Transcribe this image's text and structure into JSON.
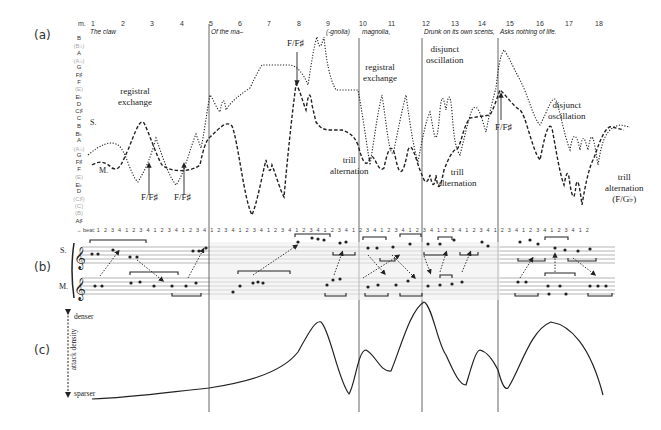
{
  "panels": {
    "a": {
      "label": "(a)",
      "measure_prefix": "m.",
      "measures": [
        "1",
        "2",
        "3",
        "4",
        "5",
        "6",
        "7",
        "8",
        "9",
        "10",
        "11",
        "12",
        "13",
        "14",
        "15",
        "16",
        "17",
        "18"
      ],
      "lyrics": [
        "The claw",
        "Of the ma–",
        "(-gnolia)",
        "magnolia,",
        "Drunk on its own scents,",
        "Asks nothing of life."
      ],
      "pitch_axis": [
        {
          "label": "B",
          "dim": false
        },
        {
          "label": "(B♭)",
          "dim": true
        },
        {
          "label": "A",
          "dim": false
        },
        {
          "label": "(A♭)",
          "dim": true
        },
        {
          "label": "G",
          "dim": false
        },
        {
          "label": "F♯",
          "dim": false
        },
        {
          "label": "F",
          "dim": false
        },
        {
          "label": "(E)",
          "dim": true
        },
        {
          "label": "E♭",
          "dim": false
        },
        {
          "label": "D",
          "dim": false
        },
        {
          "label": "C♯",
          "dim": false
        },
        {
          "label": "C",
          "dim": false
        },
        {
          "label": "B",
          "dim": false
        },
        {
          "label": "B♭",
          "dim": false
        },
        {
          "label": "A",
          "dim": false
        },
        {
          "label": "(A♭)",
          "dim": true
        },
        {
          "label": "G",
          "dim": false
        },
        {
          "label": "F♯",
          "dim": false
        },
        {
          "label": "F",
          "dim": false
        },
        {
          "label": "(E)",
          "dim": true
        },
        {
          "label": "E♭",
          "dim": false
        },
        {
          "label": "D",
          "dim": false
        },
        {
          "label": "(C♯)",
          "dim": true
        },
        {
          "label": "(C)",
          "dim": true
        },
        {
          "label": "(B)",
          "dim": true
        },
        {
          "label": "A♯",
          "dim": false
        }
      ],
      "voice_labels": {
        "soprano": "S.",
        "mezzo": "M."
      },
      "annotations": {
        "registral_exchange_1": "registral\nexchange",
        "registral_exchange_2": "registral\nexchange",
        "disjunct_oscillation_1": "disjunct\noscillation",
        "disjunct_oscillation_2": "disjunct\noscillation",
        "trill_alternation_1": "trill\nalternation",
        "trill_alternation_2": "trill\nalternation",
        "trill_alternation_3": "trill\nalternation\n(F/G♭)",
        "ff_sharp_1": "F/F♯",
        "ff_sharp_2": "F/F♯",
        "ff_sharp_3": "F/F♯",
        "ff_sharp_4": "F/F♯"
      }
    },
    "b": {
      "label": "(b)",
      "beat_prefix": "→ beat:",
      "beats": "1 2 3 4 1 2 3 4 1 2 3 4 1 2 3 4 1 2 3 4 1 2 3 4 1 2 3 4 1 2 3 4 1 2 3 4 1 2 3 4 1 2 3 4 1 2 3 4 1 2 3 4 1 2 3 4 1 2 3 4 1 2 3 4 1 2 3 4 1 2",
      "staff_labels": {
        "soprano": "S.",
        "mezzo": "M."
      }
    },
    "c": {
      "label": "(c)",
      "axis_title": "attack density",
      "top_label": "denser",
      "bottom_label": "sparser"
    }
  },
  "section_boundaries_x": [
    209,
    359,
    422,
    498
  ],
  "colors": {
    "ink": "#222222",
    "dim": "#aaaaaa",
    "shade": "#eeeeee",
    "rule": "#555555"
  }
}
